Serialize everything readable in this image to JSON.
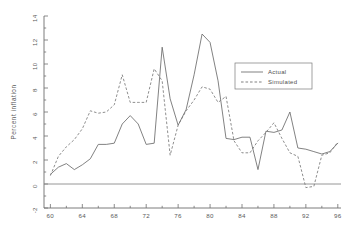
{
  "chart_data": {
    "type": "line",
    "title": "",
    "xlabel": "",
    "ylabel": "Percent inflation",
    "xlim": [
      59.2,
      96.4
    ],
    "ylim": [
      -2,
      14
    ],
    "grid": false,
    "legend_position": "upper-right",
    "xticks": [
      60,
      64,
      68,
      72,
      76,
      80,
      84,
      88,
      92,
      96
    ],
    "xtick_labels": [
      "60",
      "64",
      "68",
      "72",
      "76",
      "80",
      "84",
      "88",
      "92",
      "96"
    ],
    "xminor_step": 2,
    "yticks": [
      -2,
      0,
      2,
      4,
      6,
      8,
      10,
      12,
      14
    ],
    "ytick_labels": [
      "-2",
      "0",
      "2",
      "4",
      "6",
      "8",
      "10",
      "12",
      "14"
    ],
    "yminor_step": 1,
    "zero_reference_line": 0,
    "x": [
      60,
      61,
      62,
      63,
      64,
      65,
      66,
      67,
      68,
      69,
      70,
      71,
      72,
      73,
      74,
      75,
      76,
      77,
      78,
      79,
      80,
      81,
      82,
      83,
      84,
      85,
      86,
      87,
      88,
      89,
      90,
      91,
      92,
      93,
      94,
      95,
      96
    ],
    "series": [
      {
        "name": "Actual",
        "style": "solid",
        "color": "#6b6b6b",
        "values": [
          0.8,
          1.4,
          1.7,
          1.2,
          1.6,
          2.1,
          3.3,
          3.3,
          3.4,
          5.0,
          5.7,
          5.0,
          3.3,
          3.4,
          11.4,
          7.1,
          4.9,
          6.2,
          9.1,
          12.5,
          11.8,
          8.6,
          3.8,
          3.7,
          3.9,
          3.9,
          1.2,
          4.4,
          4.3,
          4.5,
          6.0,
          3.0,
          2.9,
          2.7,
          2.5,
          2.7,
          3.4
        ]
      },
      {
        "name": "Simulated",
        "style": "dashed",
        "color": "#7a7a7a",
        "values": [
          0.7,
          2.3,
          3.1,
          3.7,
          4.6,
          6.1,
          5.9,
          6.0,
          6.6,
          9.1,
          6.8,
          6.8,
          6.8,
          9.6,
          8.6,
          2.4,
          4.9,
          6.1,
          7.0,
          8.1,
          7.9,
          6.8,
          7.3,
          3.6,
          2.6,
          2.6,
          3.6,
          4.3,
          5.1,
          3.8,
          2.6,
          2.3,
          -0.3,
          -0.2,
          2.4,
          2.6,
          3.5
        ]
      }
    ]
  },
  "legend": {
    "entries": [
      {
        "label": "Actual",
        "style": "solid"
      },
      {
        "label": "Simulated",
        "style": "dashed"
      }
    ]
  }
}
